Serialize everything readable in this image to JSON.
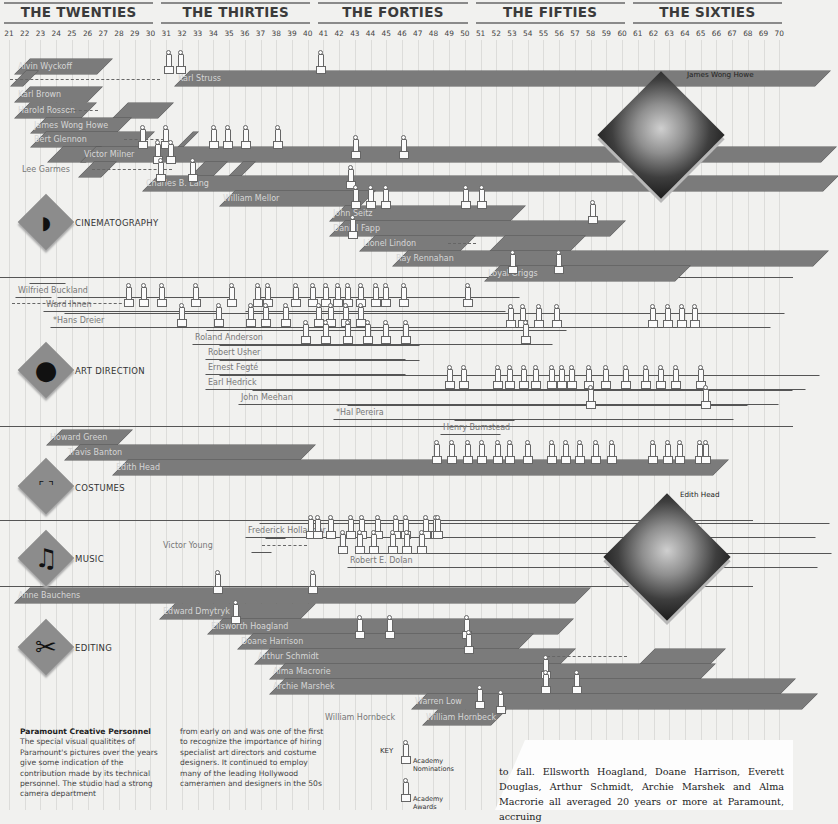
{
  "chart_data": {
    "type": "timeline",
    "title": "Paramount Creative Personnel",
    "x_axis": {
      "start_year": 1921,
      "end_year": 1970,
      "tick_labels": [
        "21",
        "22",
        "23",
        "24",
        "25",
        "26",
        "27",
        "28",
        "29",
        "30",
        "31",
        "32",
        "33",
        "34",
        "35",
        "36",
        "37",
        "38",
        "39",
        "40",
        "41",
        "42",
        "43",
        "44",
        "45",
        "46",
        "47",
        "48",
        "49",
        "50",
        "51",
        "52",
        "53",
        "54",
        "55",
        "56",
        "57",
        "58",
        "59",
        "60",
        "61",
        "62",
        "63",
        "64",
        "65",
        "66",
        "67",
        "68",
        "69",
        "70"
      ]
    },
    "decades": [
      "THE TWENTIES",
      "THE THIRTIES",
      "THE FORTIES",
      "THE FIFTIES",
      "THE SIXTIES"
    ],
    "legend": [
      {
        "symbol": "small-oscar",
        "label": "Academy Nominations"
      },
      {
        "symbol": "large-oscar",
        "label": "Academy Awards"
      }
    ],
    "categories": [
      {
        "name": "CINEMATOGRAPHY",
        "people": [
          {
            "name": "Alvin Wyckoff",
            "start": 1921,
            "end": 1927,
            "row": 0
          },
          {
            "name": "Karl Struss",
            "start": 1931,
            "end": 1970,
            "row": 1,
            "gap_from": 1921,
            "oscars": [
              1931.8,
              1932.8,
              1941.7
            ]
          },
          {
            "name": "Karl Brown",
            "start": 1921,
            "end": 1925.5,
            "row": 2
          },
          {
            "name": "Harold Rosson",
            "start": 1921,
            "end": 1925.5,
            "row": 3,
            "later": [
              1927.7,
              1929.5
            ]
          },
          {
            "name": "James Wong Howe",
            "start": 1922,
            "end": 1927,
            "row": 4
          },
          {
            "name": "Bert Glennon",
            "start": 1923,
            "end": 1929.5,
            "row": 5,
            "later": [
              1930.5,
              1932.2
            ]
          },
          {
            "name": "Victor Milner",
            "start": 1924,
            "end": 1970,
            "row": 6,
            "oscars": [
              1930.8,
              1933,
              1935,
              1936,
              1937,
              1939.6
            ]
          },
          {
            "name": "Lee Garmes",
            "start": 1926,
            "end": 1927.5,
            "row": 7,
            "label_outside": true
          },
          {
            "name": "Charles B. Lang",
            "start": 1929,
            "end": 1970,
            "row": 8,
            "oscars": [
              1931.5,
              1932.5,
              1940.5,
              1945.7,
              1946.7,
              1953.6
            ]
          },
          {
            "name": "William Mellor",
            "start": 1934,
            "end": 1945,
            "row": 9
          },
          {
            "name": "John Seitz",
            "start": 1945,
            "end": 1955.5,
            "row": 10,
            "oscars": [
              1945.7,
              1946.7,
              1947.7,
              1954.2,
              1955.2
            ]
          },
          {
            "name": "Daniel Fapp",
            "start": 1945,
            "end": 1962,
            "row": 11,
            "oscars": [
              1946.7,
              1961.3
            ]
          },
          {
            "name": "Lionel Lindon",
            "start": 1947,
            "end": 1970,
            "row": 12,
            "gap": [
              1950.5,
              1952.5
            ]
          },
          {
            "name": "Ray Rennahan",
            "start": 1949,
            "end": 1970,
            "row": 13
          },
          {
            "name": "Loyal Griggs",
            "start": 1951,
            "end": 1964.5,
            "row": 14,
            "oscars": [
              1953.5,
              1956.5
            ]
          }
        ]
      },
      {
        "name": "ART DIRECTION",
        "people": [
          {
            "name": "Wilfried Buckland",
            "start": 1921,
            "end": 1922,
            "row": 0
          },
          {
            "name": "Wiard Ihnen",
            "start": 1922,
            "end": 1970,
            "row": 1,
            "outline": true
          },
          {
            "name": "*Hans Dreier",
            "start": 1923,
            "end": 1970,
            "row": 2,
            "outline": true
          },
          {
            "name": "Roland Anderson",
            "start": 1933,
            "end": 1970,
            "row": 3,
            "outline": true
          },
          {
            "name": "Robert Usher",
            "start": 1934,
            "end": 1970,
            "row": 4,
            "outline": true
          },
          {
            "name": "Ernest Fegté",
            "start": 1934,
            "end": 1970,
            "row": 5,
            "outline": true
          },
          {
            "name": "Earl Hedrick",
            "start": 1934,
            "end": 1970,
            "row": 6,
            "outline": true
          },
          {
            "name": "John Meehan",
            "start": 1936,
            "end": 1970,
            "row": 7,
            "outline": true
          },
          {
            "name": "*Hal Pereira",
            "start": 1942,
            "end": 1970,
            "row": 8,
            "outline": true
          },
          {
            "name": "Henry Bumstead",
            "start": 1948,
            "end": 1970,
            "row": 9,
            "outline": true
          }
        ]
      },
      {
        "name": "COSTUMES",
        "people": [
          {
            "name": "Howard Greer",
            "start": 1923,
            "end": 1927,
            "row": 0
          },
          {
            "name": "Travis Banton",
            "start": 1924,
            "end": 1937,
            "row": 1
          },
          {
            "name": "Edith Head",
            "start": 1926,
            "end": 1970,
            "row": 2
          }
        ]
      },
      {
        "name": "MUSIC",
        "people": [
          {
            "name": "Frederick Hollander",
            "start": 1936,
            "end": 1970,
            "row": 0,
            "outline": true
          },
          {
            "name": "Victor Young",
            "start": 1936,
            "end": 1970,
            "row": 1,
            "outline": true
          },
          {
            "name": "Robert E. Dolan",
            "start": 1942,
            "end": 1970,
            "row": 2,
            "outline": true
          }
        ]
      },
      {
        "name": "EDITING",
        "people": [
          {
            "name": "Anne Bauchens",
            "start": 1921,
            "end": 1970,
            "row": 0
          },
          {
            "name": "Edward Dmytryk",
            "start": 1929,
            "end": 1940,
            "row": 1
          },
          {
            "name": "Ellsworth Hoagland",
            "start": 1933,
            "end": 1970,
            "row": 2
          },
          {
            "name": "Doane Harrison",
            "start": 1935,
            "end": 1970,
            "row": 3
          },
          {
            "name": "Arthur Schmidt",
            "start": 1936,
            "end": 1970,
            "row": 4
          },
          {
            "name": "Alma Macrorie",
            "start": 1937,
            "end": 1970,
            "row": 5
          },
          {
            "name": "Archie Marshek",
            "start": 1937,
            "end": 1970,
            "row": 6
          },
          {
            "name": "Warren Low",
            "start": 1950,
            "end": 1970,
            "row": 7
          },
          {
            "name": "William Hornbeck",
            "start": 1950,
            "end": 1955,
            "row": 8
          }
        ]
      }
    ]
  },
  "header": {
    "decades": [
      "THE TWENTIES",
      "THE THIRTIES",
      "THE FORTIES",
      "THE FIFTIES",
      "THE SIXTIES"
    ],
    "years": [
      "21",
      "22",
      "23",
      "24",
      "25",
      "26",
      "27",
      "28",
      "29",
      "30",
      "31",
      "32",
      "33",
      "34",
      "35",
      "36",
      "37",
      "38",
      "39",
      "40",
      "41",
      "42",
      "43",
      "44",
      "45",
      "46",
      "47",
      "48",
      "49",
      "50",
      "51",
      "52",
      "53",
      "54",
      "55",
      "56",
      "57",
      "58",
      "59",
      "60",
      "61",
      "62",
      "63",
      "64",
      "65",
      "66",
      "67",
      "68",
      "69",
      "70"
    ]
  },
  "categories": {
    "cinematography": "CINEMATOGRAPHY",
    "art_direction": "ART DIRECTION",
    "costumes": "COSTUMES",
    "music": "MUSIC",
    "editing": "EDITING"
  },
  "bars": [
    {
      "label": "Alvin Wyckoff",
      "x": 0,
      "y": 59,
      "w": 82,
      "fill": true,
      "labelClass": "light"
    },
    {
      "label": "Karl Struss",
      "x": 160,
      "y": 71,
      "w": 640,
      "fill": true
    },
    {
      "label": "",
      "x": -4,
      "y": 71,
      "w": 12,
      "fill": true
    },
    {
      "label": "Karl Brown",
      "x": 0,
      "y": 87,
      "w": 72,
      "fill": true
    },
    {
      "label": "Harold Rosson",
      "x": 0,
      "y": 103,
      "w": 66,
      "fill": true
    },
    {
      "label": "",
      "x": 98,
      "y": 103,
      "w": 45,
      "fill": true
    },
    {
      "label": "James Wong Howe",
      "x": 16,
      "y": 118,
      "w": 85,
      "fill": true
    },
    {
      "label": "Bert Glennon",
      "x": 16,
      "y": 132,
      "w": 108,
      "fill": true
    },
    {
      "label": "",
      "x": 163,
      "y": 132,
      "w": 5,
      "fill": true
    },
    {
      "label": "",
      "x": 33,
      "y": 147,
      "w": 38,
      "fill": true
    },
    {
      "label": "Victor Milner",
      "x": 66,
      "y": 147,
      "w": 740,
      "fill": true
    },
    {
      "label": "",
      "x": 64,
      "y": 162,
      "w": 22,
      "fill": true
    },
    {
      "label": "",
      "x": 175,
      "y": 162,
      "w": 22,
      "fill": true
    },
    {
      "label": "",
      "x": 213,
      "y": 162,
      "w": 12,
      "fill": true
    },
    {
      "label": "Charles B. Lang",
      "x": 128,
      "y": 176,
      "w": 680,
      "fill": true
    },
    {
      "label": "William Mellor",
      "x": 205,
      "y": 191,
      "w": 140,
      "fill": true
    },
    {
      "label": "John Seitz",
      "x": 315,
      "y": 206,
      "w": 180,
      "fill": true
    },
    {
      "label": "Daniel Fapp",
      "x": 315,
      "y": 221,
      "w": 280,
      "fill": true
    },
    {
      "label": "Lionel Lindon",
      "x": 345,
      "y": 236,
      "w": 100,
      "fill": true
    },
    {
      "label": "",
      "x": 475,
      "y": 236,
      "w": 80,
      "fill": true
    },
    {
      "label": "Ray Rennahan",
      "x": 378,
      "y": 251,
      "w": 420,
      "fill": true
    },
    {
      "label": "Loyal Griggs",
      "x": 470,
      "y": 266,
      "w": 190,
      "fill": true
    }
  ],
  "art_bars": [
    {
      "label": "Wilfried Buckland",
      "x": 0,
      "y": 283,
      "w": 36
    },
    {
      "label": "Ward Ihnen",
      "x": 28,
      "y": 297,
      "w": 175
    },
    {
      "label": "",
      "x": 230,
      "y": 297,
      "w": 260
    },
    {
      "label": "*Hans Dreier",
      "x": 35,
      "y": 313,
      "w": 720
    },
    {
      "label": "Roland Anderson",
      "x": 177,
      "y": 330,
      "w": 360
    },
    {
      "label": "Robert Usher",
      "x": 190,
      "y": 345,
      "w": 200
    },
    {
      "label": "Ernest Fegté",
      "x": 190,
      "y": 360,
      "w": 200
    },
    {
      "label": "Earl Hedrick",
      "x": 190,
      "y": 375,
      "w": 600
    },
    {
      "label": "John Meehan",
      "x": 223,
      "y": 390,
      "w": 540
    },
    {
      "label": "*Hal Pereira",
      "x": 318,
      "y": 405,
      "w": 400
    },
    {
      "label": "Henry Bumstead",
      "x": 425,
      "y": 420,
      "w": 60
    }
  ],
  "costume_bars": [
    {
      "label": "Howard Green",
      "x": 32,
      "y": 430,
      "w": 70
    },
    {
      "label": "Travis Banton",
      "x": 50,
      "y": 445,
      "w": 235
    },
    {
      "label": "Edith Head",
      "x": 98,
      "y": 460,
      "w": 600
    }
  ],
  "music_bars": [
    {
      "label": "Frederick Hollander",
      "x": 230,
      "y": 523,
      "w": 570
    },
    {
      "label": "",
      "x": 236,
      "y": 538,
      "w": 20
    },
    {
      "label": "Robert E. Dolan",
      "x": 332,
      "y": 553,
      "w": 470
    }
  ],
  "editing_bars": [
    {
      "label": "Anne Bauchens",
      "x": 0,
      "y": 588,
      "w": 560
    },
    {
      "label": "Edward Dmytryk",
      "x": 145,
      "y": 604,
      "w": 140
    },
    {
      "label": "Ellsworth Hoagland",
      "x": 193,
      "y": 619,
      "w": 350
    },
    {
      "label": "Doane Harrison",
      "x": 223,
      "y": 634,
      "w": 280
    },
    {
      "label": "Arthur Schmidt",
      "x": 240,
      "y": 649,
      "w": 305
    },
    {
      "label": "",
      "x": 625,
      "y": 649,
      "w": 70
    },
    {
      "label": "Alma Macrorie",
      "x": 255,
      "y": 664,
      "w": 430
    },
    {
      "label": "Archie Marshek",
      "x": 255,
      "y": 679,
      "w": 510
    },
    {
      "label": "Warren Low",
      "x": 397,
      "y": 694,
      "w": 390
    },
    {
      "label": "William Hornbeck",
      "x": 408,
      "y": 710,
      "w": 68
    }
  ],
  "outside_labels": {
    "lee_garmes": "Lee Garmes",
    "victor_young": "Victor Young",
    "william_hornbeck": "William Hornbeck"
  },
  "photos": {
    "howe_caption": "James Wong Howe",
    "head_caption": "Edith Head"
  },
  "notes": {
    "title": "Paramount Creative Personnel",
    "col1": "The special visual qualitites of Paramount's pictures over the years give some indication of the contribution made by its technical personnel. The studio had a strong camera department",
    "col2": "from early on and was one of the first to recognize the importance of hiring specialist art directors and costume designers. It continued to employ many of the leading Hollywood cameramen and designers in the 50s"
  },
  "key": {
    "title": "KEY",
    "nominations": "Academy Nominations",
    "awards": "Academy Awards"
  },
  "prose": "to fall. Ellsworth Hoagland, Doane Harrison, Everett Douglas, Arthur Schmidt, Archie Marshek and Alma Macrorie all averaged 20 years or more at Paramount, accruing",
  "oscars": [
    [
      163,
      50
    ],
    [
      175,
      50
    ],
    [
      315,
      50
    ],
    [
      137,
      125
    ],
    [
      160,
      125
    ],
    [
      208,
      125
    ],
    [
      222,
      125
    ],
    [
      240,
      125
    ],
    [
      272,
      125
    ],
    [
      152,
      140
    ],
    [
      165,
      140
    ],
    [
      155,
      158
    ],
    [
      187,
      158
    ],
    [
      350,
      135
    ],
    [
      398,
      135
    ],
    [
      345,
      165
    ],
    [
      350,
      185
    ],
    [
      365,
      185
    ],
    [
      380,
      185
    ],
    [
      460,
      185
    ],
    [
      476,
      185
    ],
    [
      587,
      200
    ],
    [
      347,
      215
    ],
    [
      507,
      250
    ],
    [
      553,
      250
    ],
    [
      123,
      283
    ],
    [
      138,
      283
    ],
    [
      156,
      283
    ],
    [
      190,
      283
    ],
    [
      226,
      283
    ],
    [
      252,
      283
    ],
    [
      262,
      283
    ],
    [
      290,
      283
    ],
    [
      307,
      283
    ],
    [
      320,
      283
    ],
    [
      332,
      283
    ],
    [
      342,
      283
    ],
    [
      355,
      283
    ],
    [
      370,
      283
    ],
    [
      380,
      283
    ],
    [
      398,
      283
    ],
    [
      462,
      283
    ],
    [
      176,
      303
    ],
    [
      213,
      303
    ],
    [
      245,
      303
    ],
    [
      260,
      303
    ],
    [
      280,
      303
    ],
    [
      313,
      303
    ],
    [
      325,
      303
    ],
    [
      340,
      303
    ],
    [
      355,
      303
    ],
    [
      505,
      304
    ],
    [
      517,
      304
    ],
    [
      533,
      304
    ],
    [
      551,
      304
    ],
    [
      647,
      304
    ],
    [
      662,
      304
    ],
    [
      676,
      304
    ],
    [
      689,
      304
    ],
    [
      300,
      320
    ],
    [
      320,
      320
    ],
    [
      342,
      320
    ],
    [
      362,
      320
    ],
    [
      380,
      320
    ],
    [
      400,
      320
    ],
    [
      520,
      320
    ],
    [
      444,
      365
    ],
    [
      458,
      365
    ],
    [
      492,
      365
    ],
    [
      504,
      365
    ],
    [
      518,
      365
    ],
    [
      530,
      365
    ],
    [
      546,
      365
    ],
    [
      556,
      365
    ],
    [
      566,
      365
    ],
    [
      583,
      365
    ],
    [
      600,
      365
    ],
    [
      620,
      365
    ],
    [
      640,
      365
    ],
    [
      655,
      365
    ],
    [
      670,
      365
    ],
    [
      695,
      365
    ],
    [
      585,
      385
    ],
    [
      700,
      385
    ],
    [
      431,
      440
    ],
    [
      446,
      440
    ],
    [
      462,
      440
    ],
    [
      476,
      440
    ],
    [
      492,
      440
    ],
    [
      504,
      440
    ],
    [
      522,
      440
    ],
    [
      546,
      440
    ],
    [
      560,
      440
    ],
    [
      574,
      440
    ],
    [
      590,
      440
    ],
    [
      606,
      440
    ],
    [
      647,
      440
    ],
    [
      662,
      440
    ],
    [
      674,
      440
    ],
    [
      694,
      440
    ],
    [
      700,
      440
    ],
    [
      305,
      515
    ],
    [
      312,
      515
    ],
    [
      325,
      515
    ],
    [
      345,
      515
    ],
    [
      356,
      515
    ],
    [
      372,
      515
    ],
    [
      390,
      515
    ],
    [
      400,
      515
    ],
    [
      420,
      515
    ],
    [
      430,
      515
    ],
    [
      432,
      515
    ],
    [
      337,
      530
    ],
    [
      354,
      530
    ],
    [
      368,
      530
    ],
    [
      387,
      530
    ],
    [
      401,
      530
    ],
    [
      416,
      530
    ],
    [
      212,
      570
    ],
    [
      307,
      570
    ],
    [
      230,
      600
    ],
    [
      354,
      615
    ],
    [
      384,
      615
    ],
    [
      461,
      615
    ],
    [
      463,
      630
    ],
    [
      540,
      655
    ],
    [
      540,
      670
    ],
    [
      571,
      670
    ],
    [
      474,
      685
    ],
    [
      495,
      690
    ]
  ]
}
